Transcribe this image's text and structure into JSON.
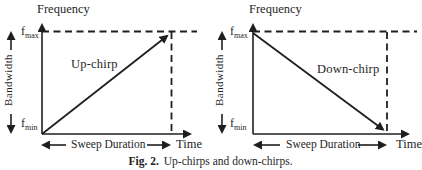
{
  "figure": {
    "caption": {
      "label": "Fig. 2.",
      "text": "Up-chirps and down-chirps."
    },
    "colors": {
      "ink": "#1f1f1f",
      "background": "#ffffff"
    },
    "panels": [
      {
        "name": "up-chirp",
        "direction": "up",
        "frequency_label": "Frequency",
        "time_label": "Time",
        "bandwidth_label": "Bandwidth",
        "sweep_label": "Sweep Duration",
        "chirp_label": "Up-chirp",
        "f_max": {
          "base": "f",
          "sub": "max"
        },
        "f_min": {
          "base": "f",
          "sub": "min"
        }
      },
      {
        "name": "down-chirp",
        "direction": "down",
        "frequency_label": "Frequency",
        "time_label": "Time",
        "bandwidth_label": "Bandwidth",
        "sweep_label": "Sweep Duration",
        "chirp_label": "Down-chirp",
        "f_max": {
          "base": "f",
          "sub": "max"
        },
        "f_min": {
          "base": "f",
          "sub": "min"
        }
      }
    ]
  }
}
